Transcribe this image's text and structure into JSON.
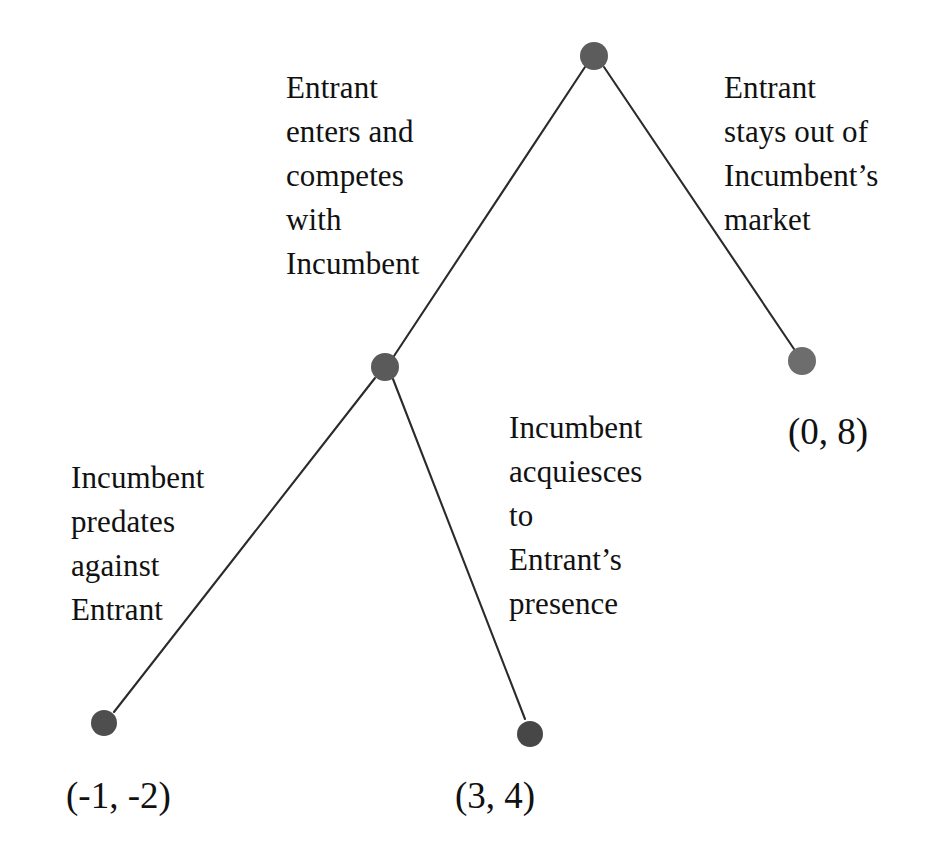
{
  "diagram": {
    "type": "extensive-form-game-tree",
    "background_color": "#ffffff",
    "edge_color": "#2b2b2b",
    "text_color": "#111111"
  },
  "nodes": [
    {
      "id": "root",
      "name": "root-decision-node",
      "player": "Entrant",
      "x": 594,
      "y": 56,
      "radius": 14,
      "color": "#5c5c5c"
    },
    {
      "id": "incumbent",
      "name": "incumbent-decision-node",
      "player": "Incumbent",
      "x": 385,
      "y": 367,
      "radius": 14,
      "color": "#5a5a5a"
    },
    {
      "id": "leaf_predate",
      "name": "terminal-node-predation",
      "x": 104,
      "y": 723,
      "radius": 13,
      "color": "#4e4e4e"
    },
    {
      "id": "leaf_acquiesce",
      "name": "terminal-node-acquiescence",
      "x": 530,
      "y": 734,
      "radius": 13,
      "color": "#474747"
    },
    {
      "id": "leaf_stayout",
      "name": "terminal-node-stay-out",
      "x": 802,
      "y": 361,
      "radius": 14,
      "color": "#6d6d6d"
    }
  ],
  "edges": [
    {
      "id": "root-to-incumbent",
      "name": "branch-enter",
      "from": "root",
      "to": "incumbent",
      "x1": 585,
      "y1": 67,
      "x2": 394,
      "y2": 356
    },
    {
      "id": "root-to-stayout",
      "name": "branch-stay-out",
      "from": "root",
      "to": "leaf_stayout",
      "x1": 604,
      "y1": 67,
      "x2": 794,
      "y2": 349
    },
    {
      "id": "incumbent-to-predate",
      "name": "branch-predate",
      "from": "incumbent",
      "to": "leaf_predate",
      "x1": 375,
      "y1": 378,
      "x2": 114,
      "y2": 712
    },
    {
      "id": "incumbent-to-acquiesce",
      "name": "branch-acquiesce",
      "from": "incumbent",
      "to": "leaf_acquiesce",
      "x1": 393,
      "y1": 379,
      "x2": 525,
      "y2": 719
    }
  ],
  "edge_labels": [
    {
      "id": "label-enter",
      "name": "edge-label-enter-and-compete",
      "text": "Entrant\nenters and\ncompetes\nwith\nIncumbent",
      "x": 286,
      "y": 66,
      "align": "left"
    },
    {
      "id": "label-stayout",
      "name": "edge-label-stays-out",
      "text": "Entrant\nstays out of\nIncumbent’s\nmarket",
      "x": 724,
      "y": 66,
      "align": "left"
    },
    {
      "id": "label-predate",
      "name": "edge-label-predates",
      "text": "Incumbent\npredates\nagainst\nEntrant",
      "x": 71,
      "y": 456,
      "align": "left"
    },
    {
      "id": "label-acquiesce",
      "name": "edge-label-acquiesces",
      "text": "Incumbent\nacquiesces\nto\nEntrant’s\npresence",
      "x": 509,
      "y": 406,
      "align": "left"
    }
  ],
  "payoffs": [
    {
      "id": "payoff-predate",
      "name": "payoff-label-predation",
      "text": "(-1, -2)",
      "entrant": -1,
      "incumbent": -2,
      "x": 66,
      "y": 774
    },
    {
      "id": "payoff-acquiesce",
      "name": "payoff-label-acquiescence",
      "text": "(3, 4)",
      "entrant": 3,
      "incumbent": 4,
      "x": 455,
      "y": 774
    },
    {
      "id": "payoff-stayout",
      "name": "payoff-label-stay-out",
      "text": "(0, 8)",
      "entrant": 0,
      "incumbent": 8,
      "x": 788,
      "y": 410
    }
  ]
}
